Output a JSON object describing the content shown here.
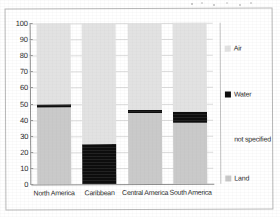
{
  "chart_data": {
    "type": "bar",
    "stacked": true,
    "title": "",
    "subtitle": "",
    "xlabel": "",
    "ylabel": "",
    "ylim": [
      0,
      100
    ],
    "yticks": [
      0,
      10,
      20,
      30,
      40,
      50,
      60,
      70,
      80,
      90,
      100
    ],
    "grid": true,
    "legend_position": "right",
    "categories": [
      "North America",
      "Caribbean",
      "Central America",
      "South America"
    ],
    "series": [
      {
        "name": "Land",
        "color": "#c9c9c9",
        "values": [
          48,
          0,
          44,
          38
        ]
      },
      {
        "name": "Water",
        "color": "#0d0d0d",
        "values": [
          2,
          25,
          2,
          7
        ]
      },
      {
        "name": "not specified",
        "color": "#ffffff",
        "values": [
          0,
          0,
          0,
          0
        ]
      },
      {
        "name": "Air",
        "color": "#e2e2e2",
        "values": [
          50,
          75,
          54,
          55
        ]
      }
    ]
  },
  "legend": {
    "items": [
      {
        "label": "Air",
        "swatch_class": "sw-air"
      },
      {
        "label": "Water",
        "swatch_class": "sw-water"
      },
      {
        "label": "not specified",
        "swatch_class": "sw-notspec"
      },
      {
        "label": "Land",
        "swatch_class": "sw-land"
      }
    ]
  }
}
